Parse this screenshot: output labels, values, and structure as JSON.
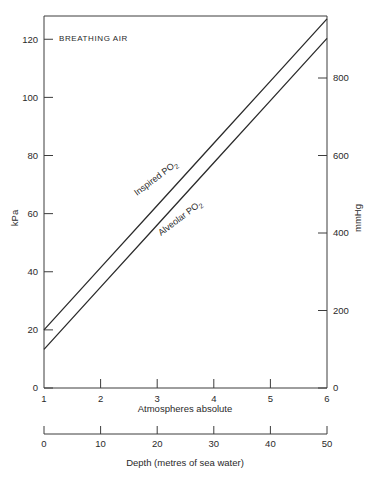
{
  "chart_data": {
    "type": "line",
    "title": "BREATHING AIR",
    "xlabel": "Atmospheres absolute",
    "ylabel": "kPa",
    "y2label": "mmHg",
    "x2label": "Depth (metres of sea water)",
    "xlim": [
      1,
      6
    ],
    "ylim": [
      0,
      128
    ],
    "y2lim": [
      0,
      960
    ],
    "x2lim": [
      0,
      50
    ],
    "grid": false,
    "legend_position": "inline-on-curve",
    "x": [
      1,
      2,
      3,
      4,
      5,
      6
    ],
    "xticks": [
      "1",
      "2",
      "3",
      "4",
      "5",
      "6"
    ],
    "yticks": [
      "0",
      "20",
      "40",
      "60",
      "80",
      "100",
      "120"
    ],
    "ytick_values": [
      0,
      20,
      40,
      60,
      80,
      100,
      120
    ],
    "y2ticks": [
      "0",
      "200",
      "400",
      "600",
      "800"
    ],
    "y2tick_values": [
      0,
      200,
      400,
      600,
      800
    ],
    "x2ticks": [
      "0",
      "10",
      "20",
      "30",
      "40",
      "50"
    ],
    "x2tick_values": [
      0,
      10,
      20,
      30,
      40,
      50
    ],
    "series": [
      {
        "name": "Inspired PO2",
        "label_main": "Inspired P",
        "label_sub": "O",
        "label_sub2": "2",
        "values": [
          20.0,
          41.4,
          62.8,
          84.2,
          105.6,
          127.0
        ]
      },
      {
        "name": "Alveolar PO2",
        "label_main": "Alveolar P",
        "label_sub": "O",
        "label_sub2": "2",
        "values": [
          13.3,
          34.7,
          56.1,
          77.5,
          98.9,
          120.3
        ]
      }
    ],
    "annotations": [
      "BREATHING AIR"
    ]
  }
}
